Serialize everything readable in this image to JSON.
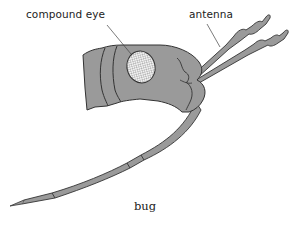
{
  "diagram": {
    "caption": "bug",
    "labels": {
      "compound_eye": "compound eye",
      "antenna": "antenna"
    },
    "colors": {
      "body_fill": "#9a9a9a",
      "outline": "#333333",
      "eye_fill": "#e8e8e8",
      "background": "#ffffff"
    }
  }
}
